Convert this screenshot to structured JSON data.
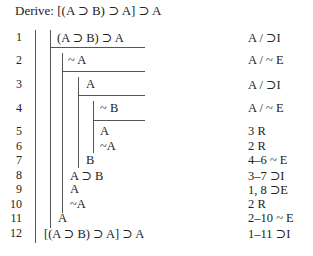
{
  "title": "Derive: [(A ⊃ B) ⊃ A] ⊃ A",
  "rows": [
    {
      "num": "1",
      "formula": "(A ⊃ B) ⊃ A",
      "just": "A / ⊃I"
    },
    {
      "num": "2",
      "formula": "~ A",
      "just": "A / ~ E"
    },
    {
      "num": "3",
      "formula": "A",
      "just": "A / ⊃I"
    },
    {
      "num": "4",
      "formula": "~ B",
      "just": "A / ~ E"
    },
    {
      "num": "5",
      "formula": "A",
      "just": "3 R"
    },
    {
      "num": "6",
      "formula": "~A",
      "just": "2 R"
    },
    {
      "num": "7",
      "formula": "B",
      "just": "4–6 ~ E"
    },
    {
      "num": "8",
      "formula": "A ⊃ B",
      "just": "3–7 ⊃I"
    },
    {
      "num": "9",
      "formula": "A",
      "just": "1, 8 ⊃E"
    },
    {
      "num": "10",
      "formula": "~A",
      "just": "2 R"
    },
    {
      "num": "11",
      "formula": "A",
      "just": "2–10 ~ E"
    },
    {
      "num": "12",
      "formula": "[(A ⊃ B) ⊃ A] ⊃ A",
      "just": "1–11 ⊃I"
    }
  ]
}
